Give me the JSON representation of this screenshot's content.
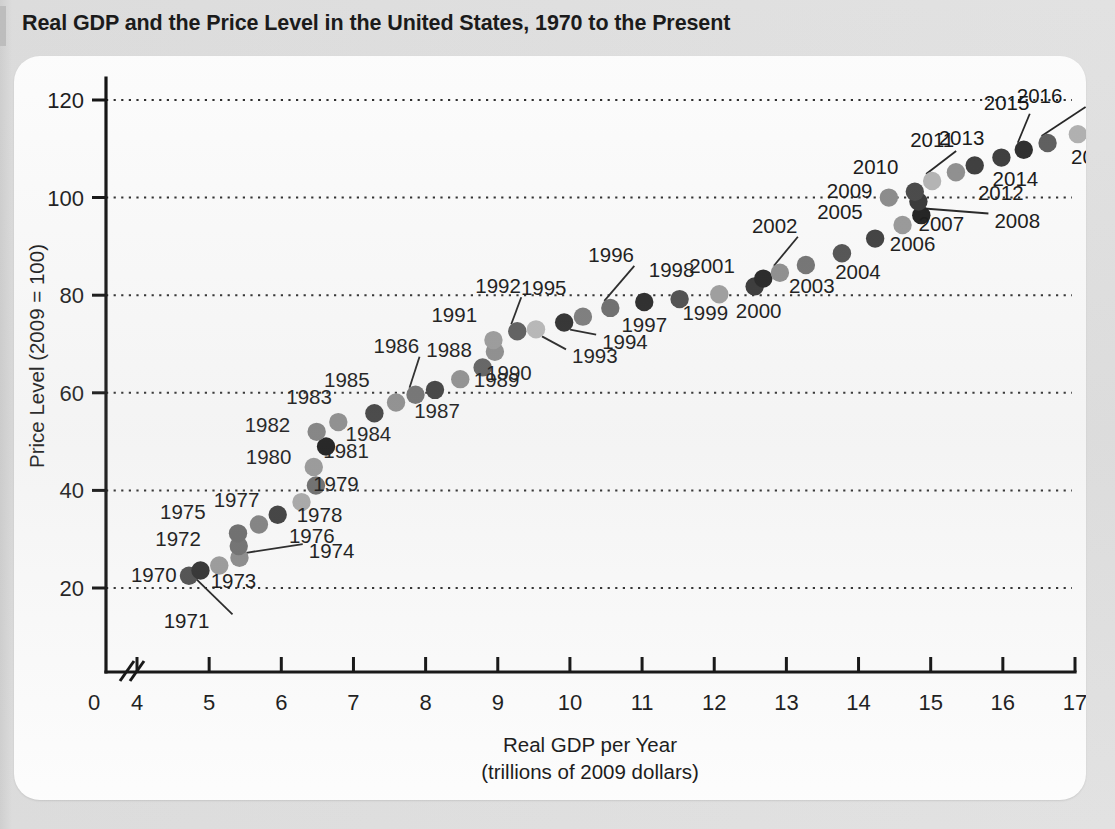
{
  "title": "Real GDP and the Price Level in the United States, 1970 to the Present",
  "chart_data": {
    "type": "scatter",
    "title": "Real GDP and the Price Level in the United States, 1970 to the Present",
    "xlabel": "Real GDP per Year",
    "xlabel_line2": "(trillions of 2009 dollars)",
    "ylabel": "Price Level (2009 = 100)",
    "xlim": [
      3.55,
      17.4
    ],
    "ylim": [
      0,
      126
    ],
    "x_axis_break": true,
    "x_break_note": "axis break between 0 and 4",
    "xticks": [
      "0",
      "4",
      "5",
      "6",
      "7",
      "8",
      "9",
      "10",
      "11",
      "12",
      "13",
      "14",
      "15",
      "16",
      "17"
    ],
    "xtick_values": [
      0,
      4,
      5,
      6,
      7,
      8,
      9,
      10,
      11,
      12,
      13,
      14,
      15,
      16,
      17
    ],
    "yticks": [
      "20",
      "40",
      "60",
      "80",
      "100",
      "120"
    ],
    "ytick_values": [
      20,
      40,
      60,
      80,
      100,
      120
    ],
    "grid": "horizontal-dotted",
    "legend": "none",
    "point_label_field": "year",
    "series": [
      {
        "name": "Real GDP vs Price Level by year",
        "points": [
          {
            "year": "1970",
            "x": 4.72,
            "y": 22.5,
            "shade": "#4d4d4d",
            "label_dx": -58,
            "label_dy": 6,
            "leader": false
          },
          {
            "year": "1971",
            "x": 4.88,
            "y": 23.6,
            "shade": "#2e2e2e",
            "label_dx": -14,
            "label_dy": 58,
            "leader": true
          },
          {
            "year": "1972",
            "x": 5.14,
            "y": 24.6,
            "shade": "#9a9a9a",
            "label_dx": -64,
            "label_dy": -20,
            "leader": false
          },
          {
            "year": "1973",
            "x": 5.42,
            "y": 26.2,
            "shade": "#8a8a8a",
            "label_dx": -6,
            "label_dy": 30,
            "leader": false
          },
          {
            "year": "1974",
            "x": 5.41,
            "y": 28.6,
            "shade": "#6e6e6e",
            "label_dx": 70,
            "label_dy": 12,
            "leader": true
          },
          {
            "year": "1975",
            "x": 5.4,
            "y": 31.2,
            "shade": "#6a6a6a",
            "label_dx": -78,
            "label_dy": -14,
            "leader": false
          },
          {
            "year": "1976",
            "x": 5.69,
            "y": 33.0,
            "shade": "#808080",
            "label_dx": 30,
            "label_dy": 18,
            "leader": false
          },
          {
            "year": "1977",
            "x": 5.95,
            "y": 35.0,
            "shade": "#3a3a3a",
            "label_dx": -64,
            "label_dy": -8,
            "leader": false
          },
          {
            "year": "1978",
            "x": 6.28,
            "y": 37.6,
            "shade": "#a8a8a8",
            "label_dx": 18,
            "label_dy": 20,
            "leader": false
          },
          {
            "year": "1979",
            "x": 6.48,
            "y": 41.0,
            "shade": "#6a6a6a",
            "label_dx": 20,
            "label_dy": 5,
            "leader": false
          },
          {
            "year": "1980",
            "x": 6.45,
            "y": 44.8,
            "shade": "#989898",
            "label_dx": -68,
            "label_dy": -3,
            "leader": false
          },
          {
            "year": "1981",
            "x": 6.62,
            "y": 49.0,
            "shade": "#141414",
            "label_dx": 20,
            "label_dy": 12,
            "leader": false
          },
          {
            "year": "1982",
            "x": 6.49,
            "y": 52.0,
            "shade": "#808080",
            "label_dx": -72,
            "label_dy": 0,
            "leader": false
          },
          {
            "year": "1983",
            "x": 6.79,
            "y": 54.0,
            "shade": "#8c8c8c",
            "label_dx": -52,
            "label_dy": -18,
            "leader": false
          },
          {
            "year": "1984",
            "x": 7.29,
            "y": 55.8,
            "shade": "#3d3d3d",
            "label_dx": -6,
            "label_dy": 28,
            "leader": false
          },
          {
            "year": "1985",
            "x": 7.59,
            "y": 58.0,
            "shade": "#8e8e8e",
            "label_dx": -72,
            "label_dy": -16,
            "leader": false
          },
          {
            "year": "1986",
            "x": 7.86,
            "y": 59.6,
            "shade": "#6f6f6f",
            "label_dx": -42,
            "label_dy": -42,
            "leader": true
          },
          {
            "year": "1987",
            "x": 8.13,
            "y": 60.6,
            "shade": "#3b3b3b",
            "label_dx": 2,
            "label_dy": 28,
            "leader": false
          },
          {
            "year": "1988",
            "x": 8.48,
            "y": 62.8,
            "shade": "#8f8f8f",
            "label_dx": -34,
            "label_dy": -22,
            "leader": false
          },
          {
            "year": "1989",
            "x": 8.79,
            "y": 65.2,
            "shade": "#5e5e5e",
            "label_dx": 14,
            "label_dy": 20,
            "leader": false
          },
          {
            "year": "1990",
            "x": 8.96,
            "y": 68.4,
            "shade": "#8c8c8c",
            "label_dx": 14,
            "label_dy": 28,
            "leader": false
          },
          {
            "year": "1991",
            "x": 8.94,
            "y": 70.8,
            "shade": "#9a9a9a",
            "label_dx": -62,
            "label_dy": -18,
            "leader": false
          },
          {
            "year": "1992",
            "x": 9.27,
            "y": 72.6,
            "shade": "#5a5a5a",
            "label_dx": -42,
            "label_dy": -38,
            "leader": true
          },
          {
            "year": "1993",
            "x": 9.53,
            "y": 73.0,
            "shade": "#b8b8b8",
            "label_dx": 36,
            "label_dy": 34,
            "leader": true
          },
          {
            "year": "1994",
            "x": 9.92,
            "y": 74.4,
            "shade": "#2a2a2a",
            "label_dx": 38,
            "label_dy": 26,
            "leader": true
          },
          {
            "year": "1995",
            "x": 10.18,
            "y": 75.6,
            "shade": "#7a7a7a",
            "label_dx": -62,
            "label_dy": -22,
            "leader": false
          },
          {
            "year": "1996",
            "x": 10.56,
            "y": 77.4,
            "shade": "#6a6a6a",
            "label_dx": -22,
            "label_dy": -46,
            "leader": true
          },
          {
            "year": "1997",
            "x": 11.03,
            "y": 78.6,
            "shade": "#242424",
            "label_dx": 0,
            "label_dy": 30,
            "leader": false
          },
          {
            "year": "1998",
            "x": 11.52,
            "y": 79.2,
            "shade": "#4a4a4a",
            "label_dx": -8,
            "label_dy": -22,
            "leader": false
          },
          {
            "year": "1999",
            "x": 12.07,
            "y": 80.2,
            "shade": "#9d9d9d",
            "label_dx": -14,
            "label_dy": 26,
            "leader": false
          },
          {
            "year": "2000",
            "x": 12.56,
            "y": 81.8,
            "shade": "#333333",
            "label_dx": 4,
            "label_dy": 32,
            "leader": false
          },
          {
            "year": "2001",
            "x": 12.68,
            "y": 83.4,
            "shade": "#202020",
            "label_dx": -74,
            "label_dy": -6,
            "leader": false
          },
          {
            "year": "2002",
            "x": 12.91,
            "y": 84.6,
            "shade": "#8d8d8d",
            "label_dx": -28,
            "label_dy": -40,
            "leader": true
          },
          {
            "year": "2003",
            "x": 13.27,
            "y": 86.2,
            "shade": "#717171",
            "label_dx": 6,
            "label_dy": 28,
            "leader": false
          },
          {
            "year": "2004",
            "x": 13.77,
            "y": 88.6,
            "shade": "#4f4f4f",
            "label_dx": 16,
            "label_dy": 26,
            "leader": false
          },
          {
            "year": "2005",
            "x": 14.23,
            "y": 91.6,
            "shade": "#3c3c3c",
            "label_dx": -58,
            "label_dy": -20,
            "leader": false
          },
          {
            "year": "2006",
            "x": 14.61,
            "y": 94.4,
            "shade": "#989898",
            "label_dx": 10,
            "label_dy": 26,
            "leader": false
          },
          {
            "year": "2007",
            "x": 14.87,
            "y": 96.4,
            "shade": "#1c1c1c",
            "label_dx": 20,
            "label_dy": 16,
            "leader": false
          },
          {
            "year": "2008",
            "x": 14.83,
            "y": 99.2,
            "shade": "#343434",
            "label_dx": 76,
            "label_dy": 26,
            "leader": true
          },
          {
            "year": "2009",
            "x": 14.42,
            "y": 100.0,
            "shade": "#8a8a8a",
            "label_dx": -62,
            "label_dy": 0,
            "leader": false
          },
          {
            "year": "2010",
            "x": 14.78,
            "y": 101.2,
            "shade": "#454545",
            "label_dx": -62,
            "label_dy": -18,
            "leader": false
          },
          {
            "year": "2011",
            "x": 15.02,
            "y": 103.4,
            "shade": "#b4b4b4",
            "label_dx": -22,
            "label_dy": -34,
            "leader": true
          },
          {
            "year": "2012",
            "x": 15.35,
            "y": 105.2,
            "shade": "#8e8e8e",
            "label_dx": 22,
            "label_dy": 28,
            "leader": false
          },
          {
            "year": "2013",
            "x": 15.61,
            "y": 106.6,
            "shade": "#3a3a3a",
            "label_dx": -36,
            "label_dy": -20,
            "leader": false
          },
          {
            "year": "2014",
            "x": 15.98,
            "y": 108.2,
            "shade": "#3a3a3a",
            "label_dx": 14,
            "label_dy": 28,
            "leader": false
          },
          {
            "year": "2015",
            "x": 16.29,
            "y": 109.8,
            "shade": "#2a2a2a",
            "label_dx": -40,
            "label_dy": -40,
            "leader": true
          },
          {
            "year": "2016",
            "x": 16.62,
            "y": 111.2,
            "shade": "#5c5c5c",
            "label_dx": -8,
            "label_dy": -40,
            "leader": true
          },
          {
            "year": "2017",
            "x": 17.04,
            "y": 113.0,
            "shade": "#b0b0b0",
            "label_dx": 16,
            "label_dy": 30,
            "leader": false
          }
        ]
      }
    ]
  }
}
